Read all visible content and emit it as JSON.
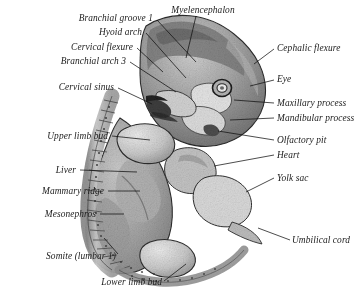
{
  "plate": {
    "title": "Human embryo anatomical plate",
    "background_color": "#ffffff",
    "ink_color": "#1a1a1a",
    "body_tone": "#a8a8a8"
  },
  "labels": {
    "myelencephalon": "Myelencephalon",
    "branchial_groove_1": "Branchial groove 1",
    "hyoid_arch": "Hyoid arch",
    "cervical_flexure": "Cervical flexure",
    "branchial_arch_3": "Branchial arch 3",
    "cervical_sinus": "Cervical sinus",
    "upper_limb_bud": "Upper limb bud",
    "liver": "Liver",
    "mammary_ridge": "Mammary ridge",
    "mesonephros": "Mesonephros",
    "somite_lumbar_1": "Somite (lumbar 1)",
    "lower_limb_bud": "Lower limb bud",
    "cephalic_flexure": "Cephalic flexure",
    "eye": "Eye",
    "maxillary_process": "Maxillary process",
    "mandibular_process": "Mandibular process",
    "olfactory_pit": "Olfactory pit",
    "heart": "Heart",
    "yolk_sac": "Yolk sac",
    "umbilical_cord": "Umbilical cord"
  },
  "structures": [
    {
      "name": "myelencephalon",
      "side": "top"
    },
    {
      "name": "branchial_groove_1",
      "side": "left"
    },
    {
      "name": "hyoid_arch",
      "side": "left"
    },
    {
      "name": "cervical_flexure",
      "side": "left"
    },
    {
      "name": "branchial_arch_3",
      "side": "left"
    },
    {
      "name": "cervical_sinus",
      "side": "left"
    },
    {
      "name": "upper_limb_bud",
      "side": "left"
    },
    {
      "name": "liver",
      "side": "left"
    },
    {
      "name": "mammary_ridge",
      "side": "left"
    },
    {
      "name": "mesonephros",
      "side": "left"
    },
    {
      "name": "somite_lumbar_1",
      "side": "left"
    },
    {
      "name": "lower_limb_bud",
      "side": "bottom"
    },
    {
      "name": "cephalic_flexure",
      "side": "right"
    },
    {
      "name": "eye",
      "side": "right"
    },
    {
      "name": "maxillary_process",
      "side": "right"
    },
    {
      "name": "mandibular_process",
      "side": "right"
    },
    {
      "name": "olfactory_pit",
      "side": "right"
    },
    {
      "name": "heart",
      "side": "right"
    },
    {
      "name": "yolk_sac",
      "side": "right"
    },
    {
      "name": "umbilical_cord",
      "side": "right"
    }
  ]
}
